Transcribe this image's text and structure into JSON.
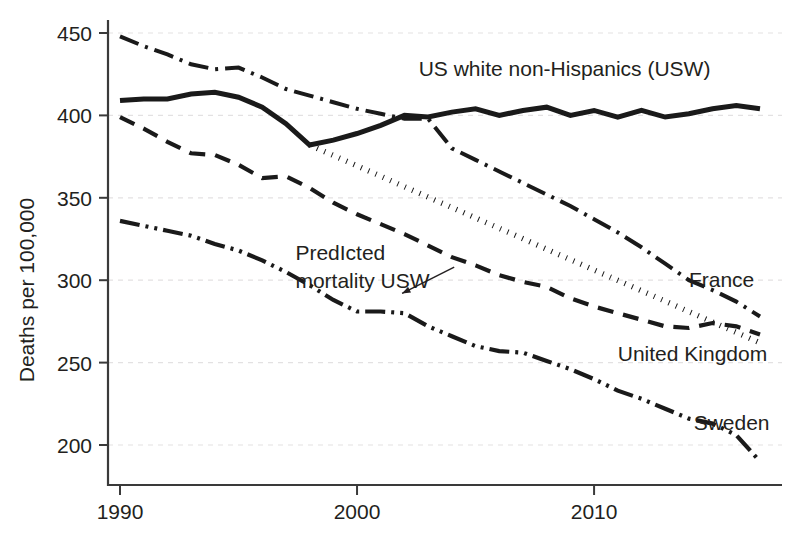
{
  "chart_data": {
    "type": "line",
    "title": "",
    "xlabel": "",
    "ylabel": "Deaths per 100,000",
    "xlim": [
      1990,
      2017
    ],
    "ylim": [
      185,
      455
    ],
    "xticks": [
      1990,
      2000,
      2010
    ],
    "xtick_labels": [
      "1990",
      "2000",
      "2010"
    ],
    "yticks": [
      200,
      250,
      300,
      350,
      400,
      450
    ],
    "ytick_labels": [
      "200",
      "250",
      "300",
      "350",
      "400",
      "450"
    ],
    "grid": "horizontal-dashed",
    "legend": "inline-end-labels",
    "x": [
      1990,
      1991,
      1992,
      1993,
      1994,
      1995,
      1996,
      1997,
      1998,
      1999,
      2000,
      2001,
      2002,
      2003,
      2004,
      2005,
      2006,
      2007,
      2008,
      2009,
      2010,
      2011,
      2012,
      2013,
      2014,
      2015,
      2016,
      2017
    ],
    "series": [
      {
        "name": "US white non-Hispanics (USW)",
        "label": "US white non-Hispanics (USW)",
        "style": "solid",
        "width": 5.0,
        "label_x": 2002.6,
        "label_y": 424,
        "values": [
          409,
          410,
          410,
          413,
          414,
          411,
          405,
          395,
          382,
          385,
          389,
          394,
          400,
          399,
          402,
          404,
          400,
          403,
          405,
          400,
          403,
          399,
          403,
          399,
          401,
          404,
          406,
          404
        ]
      },
      {
        "name": "France",
        "label": "France",
        "style": "dashdot",
        "width": 4.0,
        "label_x": 2014.0,
        "label_y": 296,
        "values": [
          448,
          442,
          437,
          431,
          428,
          429,
          423,
          416,
          412,
          408,
          404,
          401,
          398,
          398,
          380,
          373,
          366,
          359,
          352,
          345,
          337,
          329,
          320,
          310,
          300,
          294,
          287,
          278
        ]
      },
      {
        "name": "United Kingdom",
        "label": "United Kingdom",
        "style": "dashed",
        "width": 4.2,
        "label_x": 2011.0,
        "label_y": 251,
        "values": [
          399,
          392,
          384,
          377,
          376,
          370,
          362,
          363,
          356,
          347,
          340,
          334,
          328,
          321,
          314,
          309,
          303,
          299,
          296,
          289,
          284,
          280,
          276,
          272,
          271,
          274,
          272,
          267
        ]
      },
      {
        "name": "Sweden",
        "label": "Sweden",
        "style": "dashdotdot",
        "width": 4.2,
        "label_x": 2014.2,
        "label_y": 209,
        "values": [
          336,
          333,
          330,
          327,
          322,
          318,
          312,
          305,
          297,
          288,
          281,
          281,
          280,
          272,
          266,
          260,
          257,
          256,
          251,
          246,
          240,
          233,
          228,
          222,
          216,
          213,
          206,
          190
        ]
      },
      {
        "name": "Predicted mortality USW",
        "label": "",
        "style": "dotted",
        "width": 5.5,
        "label_x": 0,
        "label_y": 0,
        "values": [
          null,
          null,
          null,
          null,
          null,
          null,
          null,
          null,
          382,
          375.7,
          369.4,
          363.1,
          356.7,
          350.4,
          344.1,
          337.8,
          331.5,
          325.2,
          318.8,
          312.5,
          306.2,
          299.9,
          293.6,
          287.3,
          280.9,
          274.6,
          268.3,
          262.0
        ]
      }
    ],
    "annotations": [
      {
        "name": "predicted-mortality-annotation",
        "line1": "PredIcted",
        "line2": "mortality USW",
        "text_x": 1997.4,
        "text_y": 312,
        "arrow_from_x": 2001.9,
        "arrow_from_y": 292,
        "arrow_to_x": 2004.1,
        "arrow_to_y": 308
      }
    ],
    "colors": {
      "line": "#1a1a1a",
      "axis": "#3a3a3a",
      "grid": "#e3e1e2",
      "text": "#231f20",
      "background": "#ffffff"
    }
  }
}
